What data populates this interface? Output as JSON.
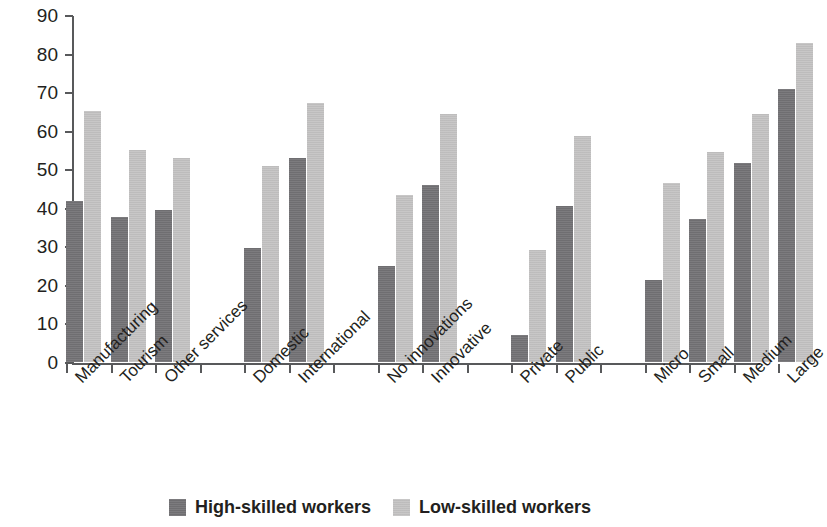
{
  "chart_data": {
    "type": "bar",
    "title": "",
    "subtitle": "",
    "xlabel": "",
    "ylabel": "",
    "ylim": [
      0,
      90
    ],
    "ytick_step": 10,
    "yticks": [
      "0",
      "10",
      "20",
      "30",
      "40",
      "50",
      "60",
      "70",
      "80",
      "90"
    ],
    "grid": false,
    "legend_position": "bottom-center",
    "orientation": "vertical",
    "categories": [
      "Manufacturing",
      "Tourism",
      "Other services",
      "Domestic",
      "International",
      "No innovations",
      "Innovative",
      "Private",
      "Public",
      "Micro",
      "Small",
      "Medium",
      "Large"
    ],
    "groups": [
      {
        "name": "Sector",
        "categories": [
          "Manufacturing",
          "Tourism",
          "Other services"
        ]
      },
      {
        "name": "Market",
        "categories": [
          "Domestic",
          "International"
        ]
      },
      {
        "name": "Innovation",
        "categories": [
          "No innovations",
          "Innovative"
        ]
      },
      {
        "name": "Ownership",
        "categories": [
          "Private",
          "Public"
        ]
      },
      {
        "name": "Size",
        "categories": [
          "Micro",
          "Small",
          "Medium",
          "Large"
        ]
      }
    ],
    "series": [
      {
        "name": "High-skilled workers",
        "color": "#757477",
        "values": [
          41.7,
          37.6,
          39.4,
          29.5,
          53.0,
          25.0,
          45.8,
          7.0,
          40.5,
          21.4,
          37.2,
          51.6,
          70.7
        ]
      },
      {
        "name": "Low-skilled workers",
        "color": "#c5c4c4",
        "values": [
          65.2,
          55.0,
          53.0,
          50.8,
          67.2,
          43.4,
          64.2,
          29.0,
          58.6,
          46.4,
          54.5,
          64.4,
          82.8
        ]
      }
    ],
    "legend": [
      {
        "label": "High-skilled workers",
        "swatch": "dark-gray-square",
        "color": "#757477"
      },
      {
        "label": "Low-skilled workers",
        "swatch": "light-gray-square",
        "color": "#c5c4c4"
      }
    ]
  }
}
